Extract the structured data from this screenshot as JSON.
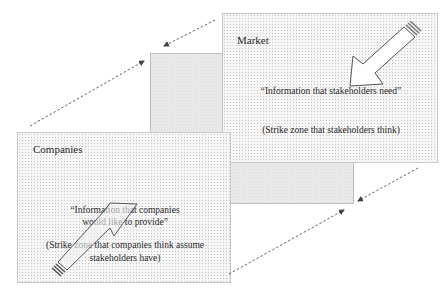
{
  "market": {
    "title": "Market",
    "quote": "“Information that  stakeholders  need”",
    "note": "(Strike zone that  stakeholders think)"
  },
  "companies": {
    "title": "Companies",
    "quote_line1": "“Information that  companies",
    "quote_line2": "would like to provide”",
    "note_line1": "(Strike zone  that  companies  think  assume",
    "note_line2": "stakeholders have)"
  },
  "colors": {
    "box_border": "#c9c9c9",
    "middle_fill": "#e9e9e9",
    "dashed_arrow": "#555555"
  }
}
